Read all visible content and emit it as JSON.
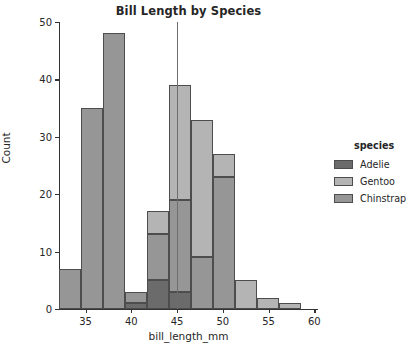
{
  "chart_data": {
    "type": "bar",
    "subtype": "stacked-histogram",
    "title": "Bill Length by Species",
    "xlabel": "bill_length_mm",
    "ylabel": "Count",
    "xlim": [
      32.1,
      60.4
    ],
    "ylim": [
      0,
      50
    ],
    "xticks": [
      35,
      40,
      45,
      50,
      55,
      60
    ],
    "yticks": [
      0,
      10,
      20,
      30,
      40,
      50
    ],
    "grid": false,
    "legend": {
      "title": "species",
      "position": "right-outside",
      "entries": [
        {
          "name": "Adelie",
          "color": "#6b6b6b"
        },
        {
          "name": "Gentoo",
          "color": "#b4b4b4"
        },
        {
          "name": "Chinstrap",
          "color": "#969696"
        }
      ]
    },
    "bin_edges": [
      32.1,
      34.5,
      36.9,
      39.3,
      41.7,
      44.1,
      46.5,
      48.9,
      51.3,
      53.7,
      56.1,
      58.5,
      60.4
    ],
    "bin_centers": [
      33.3,
      35.7,
      38.1,
      40.5,
      42.9,
      45.3,
      47.7,
      50.1,
      52.5,
      54.9,
      57.3,
      59.4
    ],
    "series": [
      {
        "name": "Adelie",
        "color": "#6b6b6b",
        "values": [
          0,
          0,
          0,
          1,
          5,
          3,
          0,
          0,
          0,
          0,
          0,
          0
        ]
      },
      {
        "name": "Chinstrap",
        "color": "#969696",
        "values": [
          7,
          35,
          48,
          2,
          8,
          16,
          9,
          23,
          0,
          0,
          0,
          0
        ]
      },
      {
        "name": "Gentoo",
        "color": "#b4b4b4",
        "values": [
          0,
          0,
          0,
          0,
          4,
          20,
          24,
          4,
          5,
          2,
          1,
          0
        ]
      }
    ],
    "bar_totals": [
      7,
      35,
      48,
      3,
      17,
      39,
      33,
      27,
      5,
      2,
      1,
      0
    ],
    "annotations": [
      {
        "type": "vline",
        "x": 45.0,
        "y_from": 0,
        "y_to": 50,
        "color": "#6e6e6e"
      }
    ]
  },
  "axis": {
    "ytick_labels": [
      "0",
      "10",
      "20",
      "30",
      "40",
      "50"
    ],
    "xtick_labels": [
      "35",
      "40",
      "45",
      "50",
      "55",
      "60"
    ]
  }
}
